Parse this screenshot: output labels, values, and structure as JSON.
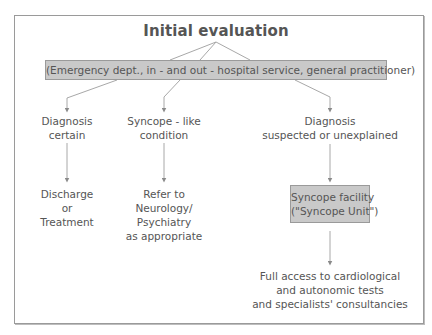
{
  "diagram": {
    "title": "Initial evaluation",
    "context": "(Emergency dept., in - and out - hospital service, general practitioner)",
    "branches": [
      {
        "decision": [
          "Diagnosis",
          "certain"
        ],
        "outcome": [
          "Discharge",
          "or",
          "Treatment"
        ]
      },
      {
        "decision": [
          "Syncope - like",
          "condition"
        ],
        "outcome": [
          "Refer to",
          "Neurology/",
          "Psychiatry",
          "as appropriate"
        ]
      },
      {
        "decision": [
          "Diagnosis",
          "suspected or unexplained"
        ],
        "facility": [
          "Syncope facility",
          "(\"Syncope Unit\")"
        ],
        "outcome": [
          "Full access to cardiological",
          "and autonomic tests",
          "and specialists' consultancies"
        ]
      }
    ],
    "colors": {
      "text": "#555555",
      "box_fill": "#c9c9c9",
      "border": "#9a9a9a",
      "line": "#a0a0a0"
    }
  }
}
